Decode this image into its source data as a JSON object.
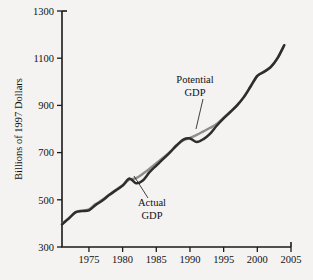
{
  "chart_data": {
    "type": "line",
    "title": "",
    "subtitle": "",
    "xlabel": "",
    "ylabel": "Billions of 1997 Dollars",
    "xlim": [
      1971,
      2005
    ],
    "ylim": [
      300,
      1300
    ],
    "grid": false,
    "legend_position": "inline-annotations",
    "x_ticks": [
      "1975",
      "1980",
      "1985",
      "1990",
      "1995",
      "2000",
      "2005"
    ],
    "x_tick_values": [
      1975,
      1980,
      1985,
      1990,
      1995,
      2000,
      2005
    ],
    "y_ticks": [
      "300",
      "500",
      "700",
      "900",
      "1100",
      "1300"
    ],
    "y_tick_values": [
      300,
      500,
      700,
      900,
      1100,
      1300
    ],
    "x": [
      1971,
      1972,
      1973,
      1974,
      1975,
      1976,
      1977,
      1978,
      1979,
      1980,
      1981,
      1982,
      1983,
      1984,
      1985,
      1986,
      1987,
      1988,
      1989,
      1990,
      1991,
      1992,
      1993,
      1994,
      1995,
      1996,
      1997,
      1998,
      1999,
      2000,
      2001,
      2002,
      2003,
      2004
    ],
    "series": [
      {
        "name": "Actual GDP",
        "color": "#2d2d2d",
        "values": [
          396,
          420,
          447,
          452,
          455,
          478,
          497,
          520,
          540,
          560,
          590,
          570,
          582,
          617,
          645,
          672,
          700,
          730,
          755,
          760,
          745,
          757,
          780,
          815,
          845,
          872,
          900,
          935,
          980,
          1025,
          1042,
          1062,
          1100,
          1155
        ]
      },
      {
        "name": "Potential GDP",
        "color": "#8d8d8d",
        "values": [
          398,
          422,
          448,
          455,
          460,
          482,
          500,
          522,
          542,
          562,
          585,
          592,
          610,
          632,
          655,
          678,
          702,
          730,
          752,
          762,
          775,
          790,
          805,
          822,
          848,
          874,
          901,
          936,
          980,
          1025,
          1044,
          1064,
          1100,
          1155
        ]
      }
    ],
    "annotations": [
      {
        "label_line1": "Potential",
        "label_line2": "GDP",
        "text_x": 195,
        "text_y": 83,
        "leader_from_x": 203,
        "leader_from_y": 99,
        "leader_to_x": 196,
        "leader_to_y": 129
      },
      {
        "label_line1": "Actual",
        "label_line2": "GDP",
        "text_x": 152,
        "text_y": 206,
        "leader_from_x": 148,
        "leader_from_y": 198,
        "leader_to_x": 134,
        "leader_to_y": 176
      }
    ],
    "colors": {
      "background": "#f4f3f1",
      "axis": "#1a1a1a",
      "actual": "#2d2d2d",
      "potential": "#8d8d8d",
      "text": "#111111"
    }
  }
}
